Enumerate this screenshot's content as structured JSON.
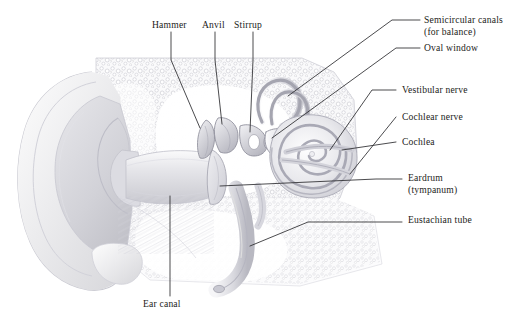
{
  "figure": {
    "style": "grayscale pencil/airbrush medical illustration",
    "background_color": "#ffffff",
    "text_color": "#1c1c20",
    "leader_line_color": "#2a2a2e"
  },
  "labels": {
    "hammer": {
      "text": "Hammer",
      "x": 152,
      "y": 24,
      "align": "left"
    },
    "anvil": {
      "text": "Anvil",
      "x": 204,
      "y": 24,
      "align": "left"
    },
    "stirrup": {
      "text": "Stirrup",
      "x": 236,
      "y": 24,
      "align": "left"
    },
    "semicircular_canals": {
      "text": "Semicircular canals",
      "x": 424,
      "y": 16,
      "align": "left"
    },
    "semicircular_canals_2": {
      "text": "(for balance)",
      "x": 424,
      "y": 28,
      "align": "left"
    },
    "oval_window": {
      "text": "Oval window",
      "x": 424,
      "y": 46,
      "align": "left"
    },
    "vestibular_nerve": {
      "text": "Vestibular nerve",
      "x": 400,
      "y": 88,
      "align": "left"
    },
    "cochlear_nerve": {
      "text": "Cochlear nerve",
      "x": 400,
      "y": 115,
      "align": "left"
    },
    "cochlea": {
      "text": "Cochlea",
      "x": 400,
      "y": 140,
      "align": "left"
    },
    "eardrum": {
      "text": "Eardrum",
      "x": 406,
      "y": 175,
      "align": "left"
    },
    "eardrum_2": {
      "text": "(tympanum)",
      "x": 406,
      "y": 187,
      "align": "left"
    },
    "eustachian_tube": {
      "text": "Eustachian tube",
      "x": 406,
      "y": 217,
      "align": "left"
    },
    "ear_canal": {
      "text": "Ear canal",
      "x": 143,
      "y": 302,
      "align": "left"
    }
  },
  "structures": [
    "pinna (auricle)",
    "ear canal (external auditory meatus)",
    "eardrum (tympanic membrane)",
    "hammer (malleus)",
    "anvil (incus)",
    "stirrup (stapes)",
    "oval window",
    "semicircular canals",
    "vestibular nerve",
    "cochlear nerve",
    "cochlea",
    "eustachian tube",
    "mastoid / temporal bone"
  ]
}
